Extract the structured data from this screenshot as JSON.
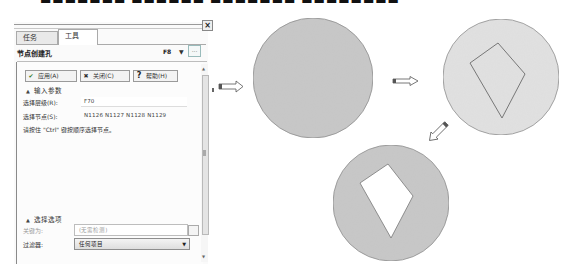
{
  "cropped_top_text": "■■■■■■■ ■■■■■■ ■■■■■■■ ■■■■■■■■■■",
  "panel": {
    "close_glyph": "×",
    "tabs": [
      {
        "label": "任务",
        "active": false
      },
      {
        "label": "工具",
        "active": true
      }
    ],
    "title": "节点创建孔",
    "hotkey": "F8",
    "hotkey_dropdown_glyph": "▼",
    "more_button": "...",
    "buttons": {
      "apply": {
        "icon": "✔",
        "label": "应用(A)"
      },
      "close": {
        "icon": "✖",
        "label": "关闭(C)"
      },
      "help": {
        "icon": "?",
        "label": "帮助(H)"
      }
    },
    "input_section": {
      "header": "输入参数",
      "collapse_glyph": "▲",
      "fields": [
        {
          "label": "选择层级(R):",
          "value": "F70"
        },
        {
          "label": "选择节点(S):",
          "value": "N1126 N1127 N1128 N1129"
        }
      ],
      "hint": "请按住 \"Ctrl\" 键按顺序选择节点。"
    },
    "selection_section": {
      "header": "选择选项",
      "collapse_glyph": "▲",
      "key_label": "关键为:",
      "key_placeholder": "(无需检测)",
      "filter_label": "过滤器:",
      "filter_value": "任何项目",
      "filter_caret": "▼"
    },
    "scrollbar": {
      "up": "▲",
      "down": "▼"
    }
  },
  "diagram": {
    "colors": {
      "dark_fill": "#c8c8c8",
      "light_fill": "#e1e1e1",
      "stroke": "#8f8f8f",
      "hole_fill": "#ffffff"
    },
    "steps": [
      {
        "name": "plain-circle",
        "cx": 313,
        "cy": 78,
        "r": 60
      },
      {
        "name": "circle-with-kite-outline",
        "cx": 501,
        "cy": 77,
        "r": 58
      },
      {
        "name": "circle-with-kite-hole",
        "cx": 391,
        "cy": 203,
        "r": 58
      }
    ]
  }
}
